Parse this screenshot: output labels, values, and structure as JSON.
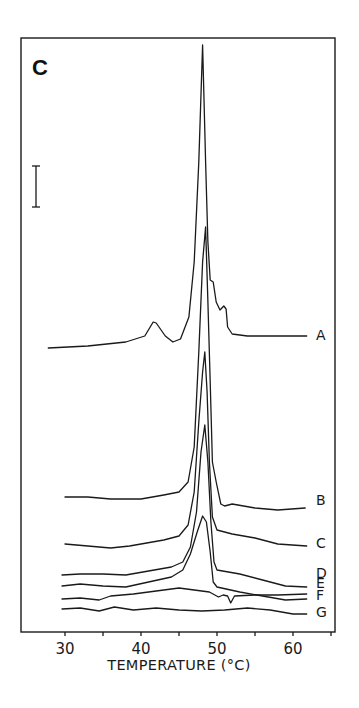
{
  "chart_data": {
    "type": "line",
    "title": "",
    "panel_label": "C",
    "xlabel": "TEMPERATURE (°C)",
    "ylabel": "",
    "xlim": [
      25,
      65.5
    ],
    "x_ticks": [
      30,
      35,
      40,
      45,
      50,
      55,
      60,
      65
    ],
    "x_tick_labels": [
      "30",
      "",
      "40",
      "",
      "50",
      "",
      "60",
      ""
    ],
    "grid": false,
    "legend": "inline labels at right end of each trace",
    "scale_bar": "vertical heat-flow scale bar (unlabeled) at upper left",
    "y_units": "arbitrary (heat flow, traces vertically offset; values = height in px above x-axis)",
    "series": [
      {
        "name": "A",
        "label_y": 335,
        "points": [
          [
            27.8,
            284
          ],
          [
            33,
            286
          ],
          [
            38,
            290
          ],
          [
            40.5,
            296
          ],
          [
            41.6,
            310
          ],
          [
            42.0,
            309
          ],
          [
            43.2,
            296
          ],
          [
            44.2,
            290
          ],
          [
            45.2,
            293
          ],
          [
            46.3,
            315
          ],
          [
            47.0,
            370
          ],
          [
            47.6,
            470
          ],
          [
            48.1,
            587
          ],
          [
            48.5,
            470
          ],
          [
            48.8,
            390
          ],
          [
            49.1,
            352
          ],
          [
            49.5,
            350
          ],
          [
            49.9,
            330
          ],
          [
            50.4,
            322
          ],
          [
            50.9,
            326
          ],
          [
            51.2,
            323
          ],
          [
            51.4,
            305
          ],
          [
            52.0,
            298
          ],
          [
            54,
            296
          ],
          [
            58,
            296
          ],
          [
            61.8,
            296
          ]
        ]
      },
      {
        "name": "B",
        "label_y": 500,
        "points": [
          [
            30,
            135
          ],
          [
            33,
            135
          ],
          [
            36,
            133
          ],
          [
            40,
            133
          ],
          [
            43,
            137
          ],
          [
            45,
            140
          ],
          [
            46.2,
            150
          ],
          [
            47.0,
            185
          ],
          [
            47.6,
            280
          ],
          [
            48.1,
            370
          ],
          [
            48.5,
            405
          ],
          [
            48.8,
            330
          ],
          [
            49.1,
            250
          ],
          [
            49.4,
            170
          ],
          [
            49.9,
            150
          ],
          [
            50.5,
            128
          ],
          [
            51,
            126
          ],
          [
            52,
            128
          ],
          [
            55,
            124
          ],
          [
            58,
            122
          ],
          [
            61.6,
            124
          ]
        ]
      },
      {
        "name": "C",
        "label_y": 543,
        "points": [
          [
            30,
            88
          ],
          [
            33,
            86
          ],
          [
            36,
            84
          ],
          [
            38.5,
            86
          ],
          [
            40,
            88
          ],
          [
            43,
            92
          ],
          [
            45,
            96
          ],
          [
            46.2,
            107
          ],
          [
            47.0,
            140
          ],
          [
            47.6,
            210
          ],
          [
            48.1,
            260
          ],
          [
            48.4,
            280
          ],
          [
            48.7,
            240
          ],
          [
            49.0,
            170
          ],
          [
            49.4,
            115
          ],
          [
            50,
            102
          ],
          [
            52,
            98
          ],
          [
            55,
            94
          ],
          [
            58,
            88
          ],
          [
            61.8,
            86
          ]
        ]
      },
      {
        "name": "D",
        "label_y": 573,
        "points": [
          [
            29.6,
            57
          ],
          [
            32,
            58
          ],
          [
            35,
            58
          ],
          [
            38,
            57
          ],
          [
            41,
            61
          ],
          [
            44,
            65
          ],
          [
            45.5,
            70
          ],
          [
            46.5,
            85
          ],
          [
            47.3,
            120
          ],
          [
            47.9,
            180
          ],
          [
            48.4,
            207
          ],
          [
            48.8,
            170
          ],
          [
            49.2,
            110
          ],
          [
            49.6,
            70
          ],
          [
            50,
            62
          ],
          [
            53,
            58
          ],
          [
            56,
            52
          ],
          [
            59,
            46
          ],
          [
            61.8,
            45
          ]
        ]
      },
      {
        "name": "E",
        "label_y": 583,
        "points": [
          [
            29.6,
            46
          ],
          [
            32,
            48
          ],
          [
            35,
            46
          ],
          [
            38,
            45
          ],
          [
            41,
            50
          ],
          [
            44,
            55
          ],
          [
            45.5,
            62
          ],
          [
            46.5,
            78
          ],
          [
            47.4,
            100
          ],
          [
            48.1,
            116
          ],
          [
            48.6,
            110
          ],
          [
            49.1,
            80
          ],
          [
            49.5,
            50
          ],
          [
            50,
            45
          ],
          [
            53,
            40
          ],
          [
            56,
            36
          ],
          [
            59,
            32
          ],
          [
            61.8,
            33
          ]
        ]
      },
      {
        "name": "F",
        "label_y": 595,
        "points": [
          [
            29.6,
            33
          ],
          [
            32,
            34
          ],
          [
            34.5,
            32
          ],
          [
            36,
            36
          ],
          [
            39,
            38
          ],
          [
            42,
            41
          ],
          [
            45,
            44
          ],
          [
            47,
            42
          ],
          [
            49,
            40
          ],
          [
            50.2,
            35
          ],
          [
            50.8,
            37
          ],
          [
            51.4,
            36
          ],
          [
            51.8,
            29
          ],
          [
            52.3,
            36
          ],
          [
            55,
            37
          ],
          [
            58,
            37
          ],
          [
            61.8,
            38
          ]
        ]
      },
      {
        "name": "G",
        "label_y": 612,
        "points": [
          [
            29.6,
            23
          ],
          [
            32,
            24
          ],
          [
            34.5,
            21
          ],
          [
            36.5,
            25
          ],
          [
            39,
            22
          ],
          [
            42,
            24
          ],
          [
            45,
            22
          ],
          [
            48,
            21
          ],
          [
            51,
            22
          ],
          [
            54,
            24
          ],
          [
            57,
            22
          ],
          [
            60,
            18
          ],
          [
            61.8,
            18
          ]
        ]
      }
    ]
  },
  "axis": {
    "tick_labels": [
      "30",
      "40",
      "50",
      "60"
    ],
    "xlabel": "TEMPERATURE (°C)"
  },
  "panel": {
    "label": "C"
  },
  "labels": {
    "A": "A",
    "B": "B",
    "C": "C",
    "D": "D",
    "E": "E",
    "F": "F",
    "G": "G"
  }
}
